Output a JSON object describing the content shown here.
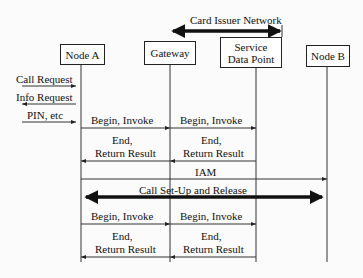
{
  "header": {
    "network_label": "Card Issuer Network"
  },
  "entities": [
    {
      "id": "node-a",
      "label": "Node A"
    },
    {
      "id": "gateway",
      "label": "Gateway"
    },
    {
      "id": "sdp",
      "label": "Service Data Point"
    },
    {
      "id": "node-b",
      "label": "Node B"
    }
  ],
  "sdp_lines": [
    "Service",
    "Data Point"
  ],
  "messages": {
    "call_request": "Call Request",
    "info_request": "Info Request",
    "pin": "PIN, etc",
    "begin_invoke": "Begin, Invoke",
    "end": "End,",
    "return_result": "Return Result",
    "iam": "IAM",
    "call_setup": "Call Set-Up and Release"
  }
}
